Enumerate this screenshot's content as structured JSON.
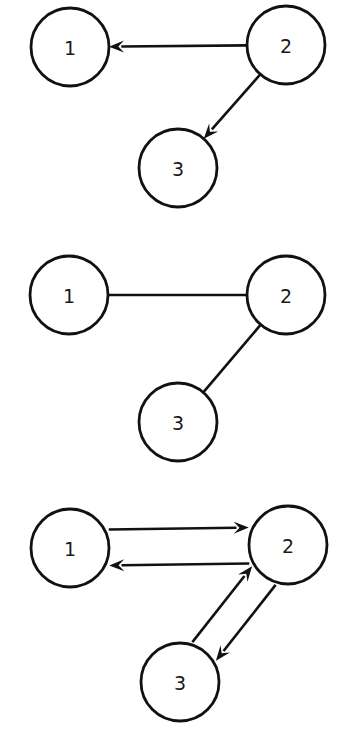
{
  "canvas": {
    "width": 345,
    "height": 737,
    "background_color": "#ffffff",
    "stroke_color": "#111111",
    "label_color": "#1a1a1a",
    "node_radius": 39,
    "edge_width": 2.6,
    "node_stroke_width": 2.8
  },
  "chart_data": {
    "type": "diagram",
    "diagram_type": "node-link-graph",
    "title": "",
    "panel_count": 3,
    "panels": [
      {
        "id": "graph-directed",
        "name": "directed-graph",
        "directed": true,
        "bidirectional": false,
        "nodes": [
          {
            "id": "1",
            "label": "1",
            "x": 70,
            "y": 47,
            "r": 39
          },
          {
            "id": "2",
            "label": "2",
            "x": 286,
            "y": 45,
            "r": 39
          },
          {
            "id": "3",
            "label": "3",
            "x": 178,
            "y": 168,
            "r": 39
          }
        ],
        "edges": [
          {
            "from": "2",
            "to": "1",
            "arrow_at": "to",
            "style": "straight"
          },
          {
            "from": "2",
            "to": "3",
            "arrow_at": "to",
            "style": "straight"
          }
        ]
      },
      {
        "id": "graph-undirected",
        "name": "undirected-graph",
        "directed": false,
        "bidirectional": false,
        "nodes": [
          {
            "id": "1",
            "label": "1",
            "x": 69,
            "y": 295,
            "r": 39
          },
          {
            "id": "2",
            "label": "2",
            "x": 286,
            "y": 295,
            "r": 39
          },
          {
            "id": "3",
            "label": "3",
            "x": 178,
            "y": 422,
            "r": 39
          }
        ],
        "edges": [
          {
            "from": "1",
            "to": "2",
            "arrow_at": "none",
            "style": "straight"
          },
          {
            "from": "2",
            "to": "3",
            "arrow_at": "none",
            "style": "straight"
          }
        ]
      },
      {
        "id": "graph-bidirectional",
        "name": "bidirectional-graph",
        "directed": true,
        "bidirectional": true,
        "nodes": [
          {
            "id": "1",
            "label": "1",
            "x": 70,
            "y": 548,
            "r": 39
          },
          {
            "id": "2",
            "label": "2",
            "x": 288,
            "y": 545,
            "r": 39
          },
          {
            "id": "3",
            "label": "3",
            "x": 180,
            "y": 682,
            "r": 39
          }
        ],
        "edges": [
          {
            "from": "2",
            "to": "1",
            "arrow_at": "to",
            "style": "parallel",
            "offset": -18
          },
          {
            "from": "1",
            "to": "2",
            "arrow_at": "to",
            "style": "parallel",
            "offset": -18
          },
          {
            "from": "2",
            "to": "3",
            "arrow_at": "to",
            "style": "parallel",
            "offset": -15
          },
          {
            "from": "3",
            "to": "2",
            "arrow_at": "to",
            "style": "parallel",
            "offset": -15
          }
        ]
      }
    ],
    "arrowhead": {
      "length": 15,
      "width": 12,
      "shape": "solid-triangle"
    },
    "legend": [],
    "annotations": []
  }
}
